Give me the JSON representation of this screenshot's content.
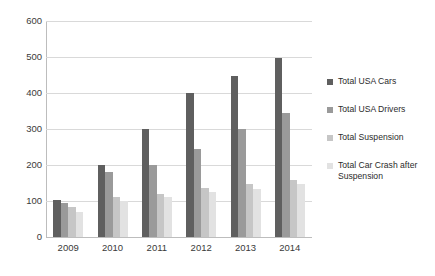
{
  "chart_data": {
    "type": "bar",
    "title": "",
    "subtitle": "",
    "xlabel": "",
    "ylabel": "",
    "categories": [
      "2009",
      "2010",
      "2011",
      "2012",
      "2013",
      "2014"
    ],
    "series": [
      {
        "name": "Total USA Cars",
        "color": "#5f5f5f",
        "values": [
          103,
          200,
          300,
          400,
          447,
          497
        ]
      },
      {
        "name": "Total USA Drivers",
        "color": "#9a9a9a",
        "values": [
          95,
          180,
          200,
          245,
          300,
          345
        ]
      },
      {
        "name": "Total Suspension",
        "color": "#c6c6c6",
        "values": [
          82,
          110,
          120,
          135,
          148,
          157
        ]
      },
      {
        "name": "Total Car Crash after Suspension",
        "color": "#e2e2e2",
        "values": [
          70,
          100,
          110,
          125,
          132,
          148
        ]
      }
    ],
    "ylim": [
      0,
      600
    ],
    "ytick_step": 100,
    "yticks": [
      "0",
      "100",
      "200",
      "300",
      "400",
      "500",
      "600"
    ],
    "grid": true,
    "legend_position": "right"
  }
}
